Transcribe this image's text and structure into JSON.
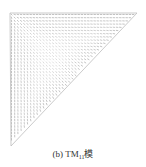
{
  "figure": {
    "type": "vector-field",
    "shape": "right-triangle",
    "vertices": [
      [
        10,
        13
      ],
      [
        137,
        13
      ],
      [
        11,
        146
      ]
    ],
    "stroke_color": "#9a9a9a",
    "edge_color": "#bdbdbd"
  },
  "caption": {
    "label": "(b)",
    "mode": "TM",
    "subscript": "11",
    "suffix": "模"
  }
}
